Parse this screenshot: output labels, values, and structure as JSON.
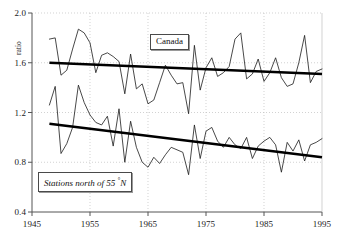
{
  "chart_data": {
    "type": "line",
    "title": "",
    "xlabel": "",
    "ylabel": "ratio",
    "xlim": [
      1945,
      1995
    ],
    "ylim": [
      0.4,
      2.0
    ],
    "xticks": [
      1945,
      1955,
      1965,
      1975,
      1985,
      1995
    ],
    "yticks": [
      0.4,
      0.8,
      1.2,
      1.6,
      2.0
    ],
    "grid": true,
    "legend_position": "inside",
    "annotations": [
      {
        "text": "Canada",
        "x": 1967,
        "y": 1.78,
        "style": "boxed"
      },
      {
        "text": "Stations north of 55 °N",
        "x": 1952,
        "y": 0.7,
        "style": "boxed-italic"
      }
    ],
    "x": [
      1948,
      1949,
      1950,
      1951,
      1952,
      1953,
      1954,
      1955,
      1956,
      1957,
      1958,
      1959,
      1960,
      1961,
      1962,
      1963,
      1964,
      1965,
      1966,
      1967,
      1968,
      1969,
      1970,
      1971,
      1972,
      1973,
      1974,
      1975,
      1976,
      1977,
      1978,
      1979,
      1980,
      1981,
      1982,
      1983,
      1984,
      1985,
      1986,
      1987,
      1988,
      1989,
      1990,
      1991,
      1992,
      1993,
      1994,
      1995
    ],
    "series": [
      {
        "name": "Canada",
        "color": "#1a1a1a",
        "values": [
          1.79,
          1.8,
          1.5,
          1.54,
          1.71,
          1.87,
          1.84,
          1.76,
          1.52,
          1.66,
          1.68,
          1.65,
          1.61,
          1.35,
          1.67,
          1.39,
          1.43,
          1.27,
          1.3,
          1.44,
          1.58,
          1.5,
          1.43,
          1.44,
          1.19,
          1.74,
          1.38,
          1.56,
          1.64,
          1.49,
          1.52,
          1.57,
          1.79,
          1.84,
          1.47,
          1.51,
          1.63,
          1.45,
          1.52,
          1.64,
          1.48,
          1.41,
          1.43,
          1.6,
          1.82,
          1.44,
          1.53,
          1.55
        ],
        "trend": {
          "start_year": 1948,
          "start_value": 1.6,
          "end_year": 1995,
          "end_value": 1.51
        }
      },
      {
        "name": "Stations north of 55 °N",
        "color": "#1a1a1a",
        "values": [
          1.26,
          1.41,
          0.87,
          0.95,
          1.08,
          1.42,
          1.28,
          1.18,
          1.12,
          1.1,
          1.17,
          0.93,
          1.23,
          0.8,
          1.13,
          0.92,
          0.8,
          0.76,
          0.84,
          0.79,
          0.86,
          0.92,
          0.9,
          0.88,
          0.7,
          1.1,
          0.83,
          1.05,
          1.08,
          0.97,
          0.92,
          1.0,
          0.94,
          0.91,
          1.0,
          0.83,
          0.93,
          0.97,
          1.0,
          0.94,
          0.72,
          0.96,
          0.89,
          0.98,
          0.81,
          0.94,
          0.96,
          0.99
        ],
        "trend": {
          "start_year": 1948,
          "start_value": 1.11,
          "end_year": 1995,
          "end_value": 0.84
        }
      }
    ]
  },
  "axis": {
    "y_tick_labels": [
      "2.0",
      "1.6",
      "1.2",
      "0.8",
      "0.4"
    ],
    "x_tick_labels": [
      "1945",
      "1955",
      "1965",
      "1975",
      "1985",
      "1995"
    ],
    "y_axis_title": "ratio"
  },
  "labels": {
    "canada": "Canada",
    "stations_prefix": "Stations north of 55 ",
    "stations_degree": "°",
    "stations_suffix": "N"
  }
}
